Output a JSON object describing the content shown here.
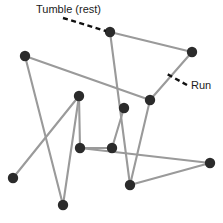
{
  "figure": {
    "width": 223,
    "height": 223,
    "background": "#ffffff"
  },
  "style": {
    "path_color": "#9a9a9a",
    "path_width": 2.1,
    "node_color": "#2b2b2b",
    "node_radius": 5.2,
    "leader_color": "#111111",
    "leader_width": 2.4,
    "leader_dash": "5,3.5",
    "label_color": "#1b1b1b",
    "label_font_size": 11
  },
  "annotations": [
    {
      "id": "tumble",
      "label": "Tumble (rest)",
      "label_x": 36,
      "label_y": 10,
      "label_anchor": "start",
      "leader": {
        "x1": 63,
        "y1": 18,
        "x2": 106,
        "y2": 31
      }
    },
    {
      "id": "run",
      "label": "Run",
      "label_x": 191,
      "label_y": 86,
      "label_anchor": "start",
      "leader": {
        "x1": 187,
        "y1": 85,
        "x2": 167,
        "y2": 74
      }
    }
  ],
  "chart_data": {
    "type": "scatter",
    "xlabel": "",
    "ylabel": "",
    "xlim": [
      0,
      223
    ],
    "ylim": [
      0,
      223
    ],
    "grid": false,
    "legend": "none",
    "nodes": [
      {
        "id": "n1",
        "name": "tumble-point-1",
        "x": 110,
        "y": 32
      },
      {
        "id": "n2",
        "name": "tumble-point-2",
        "x": 192,
        "y": 52
      },
      {
        "id": "n3",
        "name": "tumble-point-3",
        "x": 150,
        "y": 100
      },
      {
        "id": "n4",
        "name": "tumble-point-4",
        "x": 124,
        "y": 108
      },
      {
        "id": "n5",
        "name": "tumble-point-5",
        "x": 25,
        "y": 56
      },
      {
        "id": "n6",
        "name": "tumble-point-6",
        "x": 79,
        "y": 96
      },
      {
        "id": "n7",
        "name": "tumble-point-7",
        "x": 80,
        "y": 148
      },
      {
        "id": "n8",
        "name": "tumble-point-8",
        "x": 112,
        "y": 148
      },
      {
        "id": "n9",
        "name": "tumble-point-9",
        "x": 13,
        "y": 178
      },
      {
        "id": "n10",
        "name": "tumble-point-10",
        "x": 63,
        "y": 205
      },
      {
        "id": "n11",
        "name": "tumble-point-11",
        "x": 130,
        "y": 185
      },
      {
        "id": "n12",
        "name": "tumble-point-12",
        "x": 210,
        "y": 163
      }
    ],
    "edges": [
      {
        "name": "run-segment-1",
        "from": "n1",
        "to": "n2"
      },
      {
        "name": "run-segment-2",
        "from": "n2",
        "to": "n3"
      },
      {
        "name": "run-segment-3",
        "from": "n3",
        "to": "n5"
      },
      {
        "name": "run-segment-4",
        "from": "n5",
        "to": "n10"
      },
      {
        "name": "run-segment-5",
        "from": "n10",
        "to": "n6"
      },
      {
        "name": "run-segment-6",
        "from": "n6",
        "to": "n9"
      },
      {
        "name": "run-segment-7",
        "from": "n6",
        "to": "n7"
      },
      {
        "name": "run-segment-8",
        "from": "n7",
        "to": "n8"
      },
      {
        "name": "run-segment-9",
        "from": "n8",
        "to": "n4"
      },
      {
        "name": "run-segment-10",
        "from": "n1",
        "to": "n11"
      },
      {
        "name": "run-segment-11",
        "from": "n3",
        "to": "n11"
      },
      {
        "name": "run-segment-12",
        "from": "n11",
        "to": "n12"
      },
      {
        "name": "run-segment-13",
        "from": "n12",
        "to": "n7"
      }
    ]
  }
}
